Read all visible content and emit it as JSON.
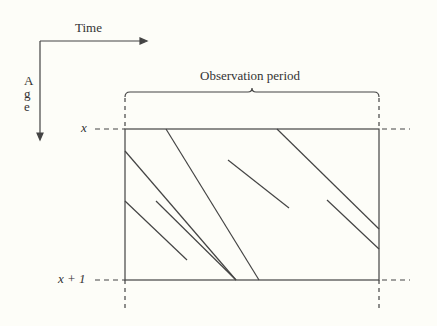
{
  "diagram": {
    "axis_time_label": "Time",
    "axis_age_label": "A g e",
    "brace_label": "Observation period",
    "age_top_label": "x",
    "age_bottom_label": "x + 1",
    "colors": {
      "background": "#fdfdf8",
      "stroke": "#444444"
    },
    "rectangle": {
      "x": 125,
      "y": 129,
      "width": 254,
      "height": 151
    },
    "lifelines": [
      {
        "x1": 166,
        "y1": 129,
        "x2": 259,
        "y2": 280
      },
      {
        "x1": 125,
        "y1": 151,
        "x2": 236,
        "y2": 280
      },
      {
        "x1": 125,
        "y1": 201,
        "x2": 187,
        "y2": 260
      },
      {
        "x1": 156,
        "y1": 201,
        "x2": 236,
        "y2": 280
      },
      {
        "x1": 277,
        "y1": 129,
        "x2": 379,
        "y2": 229
      },
      {
        "x1": 228,
        "y1": 160,
        "x2": 289,
        "y2": 208
      },
      {
        "x1": 327,
        "y1": 200,
        "x2": 379,
        "y2": 249
      }
    ]
  }
}
